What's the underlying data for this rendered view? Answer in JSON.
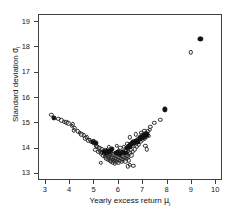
{
  "chart_data": {
    "type": "scatter",
    "title": "",
    "xlabel": "Yearly excess return μᵢ",
    "xlabel_main": "Yearly excess return ",
    "xlabel_symbol": "μ",
    "xlabel_sub": "i",
    "ylabel": "Standard deviation σᵢ",
    "ylabel_main": "Standard deviation ",
    "ylabel_symbol": "σ",
    "ylabel_sub": "i",
    "xlim": [
      2.72,
      10.28
    ],
    "ylim": [
      12.72,
      19.28
    ],
    "xticks": [
      3,
      4,
      5,
      6,
      7,
      8,
      9,
      10
    ],
    "yticks": [
      13,
      14,
      15,
      16,
      17,
      18,
      19
    ],
    "grid": false,
    "legend": null,
    "marker_colors": {
      "open": "#2b2b2b",
      "filled": "#111111",
      "frame": "#404040",
      "background": "#ffffff"
    },
    "series": [
      {
        "name": "portfolios-open",
        "marker": "open-circle",
        "points": [
          [
            3.22,
            15.33
          ],
          [
            3.52,
            15.17
          ],
          [
            3.76,
            15.06
          ],
          [
            3.84,
            15.04
          ],
          [
            3.92,
            15.0
          ],
          [
            4.06,
            14.89
          ],
          [
            4.16,
            14.72
          ],
          [
            4.18,
            14.8
          ],
          [
            4.32,
            14.69
          ],
          [
            4.46,
            14.56
          ],
          [
            4.56,
            14.52
          ],
          [
            4.62,
            14.4
          ],
          [
            4.68,
            14.45
          ],
          [
            4.74,
            14.33
          ],
          [
            4.8,
            14.36
          ],
          [
            4.86,
            14.27
          ],
          [
            4.92,
            14.22
          ],
          [
            4.96,
            14.3
          ],
          [
            5.02,
            14.18
          ],
          [
            5.04,
            13.96
          ],
          [
            5.08,
            14.12
          ],
          [
            5.12,
            14.08
          ],
          [
            5.16,
            13.88
          ],
          [
            5.2,
            14.02
          ],
          [
            5.22,
            13.92
          ],
          [
            5.26,
            13.82
          ],
          [
            5.3,
            13.98
          ],
          [
            5.32,
            13.86
          ],
          [
            5.36,
            13.74
          ],
          [
            5.38,
            13.9
          ],
          [
            5.4,
            13.8
          ],
          [
            5.42,
            13.68
          ],
          [
            5.44,
            13.95
          ],
          [
            5.46,
            13.78
          ],
          [
            5.48,
            13.62
          ],
          [
            5.5,
            13.86
          ],
          [
            5.52,
            13.72
          ],
          [
            5.54,
            13.58
          ],
          [
            5.56,
            13.8
          ],
          [
            5.58,
            13.66
          ],
          [
            5.6,
            14.06
          ],
          [
            5.62,
            13.54
          ],
          [
            5.64,
            13.76
          ],
          [
            5.66,
            13.62
          ],
          [
            5.68,
            13.5
          ],
          [
            5.7,
            13.84
          ],
          [
            5.72,
            13.7
          ],
          [
            5.74,
            13.56
          ],
          [
            5.76,
            13.46
          ],
          [
            5.78,
            13.78
          ],
          [
            5.8,
            13.64
          ],
          [
            5.82,
            13.52
          ],
          [
            5.84,
            13.42
          ],
          [
            5.86,
            13.72
          ],
          [
            5.88,
            13.6
          ],
          [
            5.9,
            13.48
          ],
          [
            5.92,
            14.1
          ],
          [
            5.94,
            13.68
          ],
          [
            5.96,
            13.56
          ],
          [
            5.98,
            13.44
          ],
          [
            6.0,
            13.9
          ],
          [
            6.02,
            13.64
          ],
          [
            6.04,
            13.52
          ],
          [
            6.06,
            14.02
          ],
          [
            6.08,
            13.74
          ],
          [
            6.1,
            13.6
          ],
          [
            6.12,
            13.48
          ],
          [
            6.14,
            13.86
          ],
          [
            6.16,
            13.7
          ],
          [
            6.18,
            13.56
          ],
          [
            6.2,
            14.08
          ],
          [
            6.22,
            13.8
          ],
          [
            6.24,
            13.64
          ],
          [
            6.26,
            13.5
          ],
          [
            6.28,
            13.94
          ],
          [
            6.3,
            13.74
          ],
          [
            6.32,
            13.6
          ],
          [
            6.34,
            14.18
          ],
          [
            6.36,
            13.88
          ],
          [
            6.38,
            13.68
          ],
          [
            6.4,
            13.54
          ],
          [
            6.42,
            14.04
          ],
          [
            6.44,
            13.82
          ],
          [
            6.46,
            13.36
          ],
          [
            6.48,
            13.96
          ],
          [
            6.52,
            13.74
          ],
          [
            6.56,
            14.12
          ],
          [
            6.58,
            13.88
          ],
          [
            6.62,
            14.22
          ],
          [
            6.66,
            13.98
          ],
          [
            6.7,
            14.3
          ],
          [
            6.74,
            14.08
          ],
          [
            6.78,
            14.38
          ],
          [
            6.82,
            14.16
          ],
          [
            6.86,
            14.46
          ],
          [
            6.9,
            14.26
          ],
          [
            6.94,
            14.52
          ],
          [
            6.98,
            14.34
          ],
          [
            7.02,
            14.58
          ],
          [
            7.06,
            14.4
          ],
          [
            7.1,
            14.62
          ],
          [
            7.14,
            14.46
          ],
          [
            7.18,
            14.68
          ],
          [
            7.22,
            14.5
          ],
          [
            7.26,
            14.74
          ],
          [
            7.08,
            14.1
          ],
          [
            7.16,
            13.98
          ],
          [
            6.6,
            13.32
          ],
          [
            6.38,
            13.3
          ],
          [
            6.92,
            14.62
          ],
          [
            7.3,
            14.86
          ],
          [
            7.46,
            15.02
          ],
          [
            7.7,
            15.14
          ],
          [
            8.96,
            17.8
          ],
          [
            5.26,
            13.44
          ],
          [
            4.4,
            14.62
          ],
          [
            4.12,
            14.96
          ],
          [
            3.64,
            15.12
          ],
          [
            6.7,
            14.56
          ],
          [
            6.44,
            14.44
          ],
          [
            7.04,
            14.7
          ]
        ]
      },
      {
        "name": "portfolios-filled",
        "marker": "filled-circle",
        "points": [
          [
            3.34,
            15.21
          ],
          [
            4.94,
            14.26
          ],
          [
            5.06,
            14.22
          ],
          [
            5.4,
            13.88
          ],
          [
            5.46,
            13.84
          ],
          [
            5.52,
            13.9
          ],
          [
            5.58,
            13.86
          ],
          [
            5.62,
            13.92
          ],
          [
            5.9,
            13.82
          ],
          [
            5.96,
            13.86
          ],
          [
            6.06,
            13.8
          ],
          [
            6.16,
            13.88
          ],
          [
            6.28,
            13.84
          ],
          [
            6.4,
            14.1
          ],
          [
            6.52,
            14.18
          ],
          [
            6.6,
            14.26
          ],
          [
            6.66,
            14.22
          ],
          [
            6.72,
            14.32
          ],
          [
            6.8,
            14.28
          ],
          [
            6.88,
            14.4
          ],
          [
            6.96,
            14.44
          ],
          [
            7.02,
            14.48
          ],
          [
            7.08,
            14.52
          ],
          [
            7.14,
            14.56
          ],
          [
            7.9,
            15.55
          ],
          [
            9.35,
            18.35
          ],
          [
            5.7,
            13.98
          ],
          [
            6.34,
            14.02
          ],
          [
            6.46,
            14.06
          ]
        ]
      }
    ]
  }
}
